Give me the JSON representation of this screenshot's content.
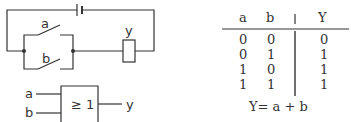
{
  "circuit": {
    "switch_a_label": "a",
    "switch_b_label": "b",
    "relay_label": "y"
  },
  "gate": {
    "input_a": "a",
    "input_b": "b",
    "symbol": "≥ 1",
    "output": "y"
  },
  "truth_table": {
    "headers": [
      "a",
      "b",
      "|",
      "Y"
    ],
    "rows": [
      [
        "0",
        "0",
        "0"
      ],
      [
        "0",
        "1",
        "1"
      ],
      [
        "1",
        "0",
        "1"
      ],
      [
        "1",
        "1",
        "1"
      ]
    ],
    "equation": "Y= a + b"
  }
}
